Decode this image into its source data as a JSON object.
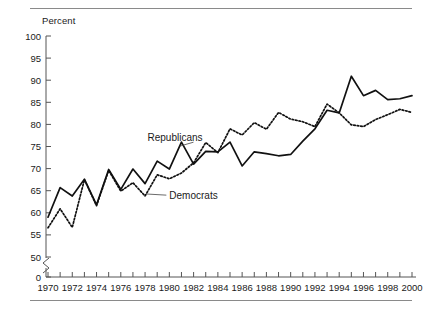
{
  "figure": {
    "y_axis_title": "Percent",
    "rules": {
      "top": "top-rule",
      "bottom": "bottom-rule"
    }
  },
  "chart_data": {
    "type": "line",
    "title": "",
    "subtitle": "",
    "xlabel": "",
    "ylabel": "Percent",
    "ylim": [
      45,
      100
    ],
    "axis_break": true,
    "axis_break_note": "y-axis broken between 0 and 50",
    "ytick_labels": [
      "100",
      "95",
      "90",
      "85",
      "80",
      "75",
      "70",
      "65",
      "60",
      "55",
      "50",
      "0"
    ],
    "ytick_values": [
      100,
      95,
      90,
      85,
      80,
      75,
      70,
      65,
      60,
      55,
      50,
      0
    ],
    "xlim": [
      1970,
      2000
    ],
    "xtick_labels": [
      "1970",
      "1972",
      "1974",
      "1976",
      "1978",
      "1980",
      "1982",
      "1984",
      "1986",
      "1988",
      "1990",
      "1992",
      "1994",
      "1996",
      "1998",
      "2000"
    ],
    "xtick_values": [
      1970,
      1972,
      1974,
      1976,
      1978,
      1980,
      1982,
      1984,
      1986,
      1988,
      1990,
      1992,
      1994,
      1996,
      1998,
      2000
    ],
    "minor_xticks_every": 1,
    "grid": false,
    "legend": "inline-annotations",
    "x": [
      1970,
      1971,
      1972,
      1973,
      1974,
      1975,
      1976,
      1977,
      1978,
      1979,
      1980,
      1981,
      1982,
      1983,
      1984,
      1985,
      1986,
      1987,
      1988,
      1989,
      1990,
      1991,
      1992,
      1993,
      1994,
      1995,
      1996,
      1997,
      1998,
      1999,
      2000
    ],
    "series": [
      {
        "name": "Republicans",
        "style": "solid",
        "color": "#111111",
        "label_x": 1978.2,
        "label_y": 76.2,
        "values": [
          59.0,
          65.7,
          63.8,
          67.6,
          61.8,
          69.8,
          65.3,
          69.9,
          66.6,
          71.7,
          69.9,
          76.0,
          71.0,
          73.9,
          73.8,
          76.0,
          70.6,
          73.8,
          73.4,
          72.9,
          73.2,
          76.2,
          79.0,
          83.2,
          82.6,
          90.9,
          86.5,
          87.7,
          85.6,
          85.8,
          86.5
        ]
      },
      {
        "name": "Democrats",
        "style": "dotted",
        "color": "#111111",
        "label_x": 1980.0,
        "label_y": 63.2,
        "values": [
          56.6,
          60.9,
          56.7,
          67.5,
          61.6,
          69.6,
          64.9,
          66.8,
          63.8,
          68.6,
          67.7,
          69.0,
          71.3,
          75.9,
          73.6,
          79.0,
          77.6,
          80.4,
          78.9,
          82.7,
          81.2,
          80.6,
          79.5,
          84.6,
          82.6,
          79.9,
          79.5,
          81.1,
          82.2,
          83.4,
          82.7
        ]
      }
    ],
    "annotations": [
      {
        "text": "Republicans",
        "points_to_series": "Republicans",
        "point_year": 1981
      },
      {
        "text": "Democrats",
        "points_to_series": "Democrats",
        "point_year": 1978
      }
    ]
  }
}
